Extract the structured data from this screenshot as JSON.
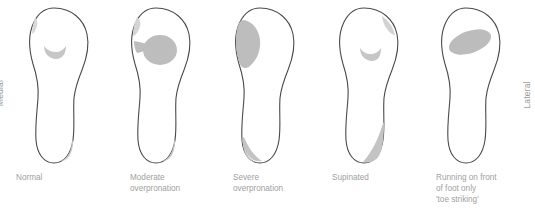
{
  "figure": {
    "background_color": "#ffffff",
    "outline_color": "#4a4a4a",
    "wear_color": "#b9b9b9",
    "wear_color_light": "#d6d6d6",
    "text_color": "#a0a0a0"
  },
  "orientation": {
    "left_label": "Medial",
    "right_label": "Lateral"
  },
  "soles": [
    {
      "id": "normal",
      "caption_lines": [
        "Normal"
      ],
      "wear_regions": [
        "small-forefoot-crescent-center",
        "faint-medial-toe-edge",
        "small-lateral-heel-wedge"
      ]
    },
    {
      "id": "moderate-overpronation",
      "caption_lines": [
        "Moderate",
        "overpronation"
      ],
      "wear_regions": [
        "large-forefoot-blob-with-medial-tail",
        "faint-medial-toe-edge",
        "small-lateral-heel-wedge"
      ]
    },
    {
      "id": "severe-overpronation",
      "caption_lines": [
        "Severe",
        "overpronation"
      ],
      "wear_regions": [
        "large-medial-forefoot-teardrop",
        "medial-heel-wedge"
      ]
    },
    {
      "id": "supinated",
      "caption_lines": [
        "Supinated"
      ],
      "wear_regions": [
        "small-forefoot-crescent-center",
        "faint-lateral-toe-patch",
        "large-lateral-heel-triangle"
      ]
    },
    {
      "id": "toe-striking",
      "caption_lines": [
        "Running on front",
        "of foot only",
        "'toe striking'"
      ],
      "wear_regions": [
        "large-diagonal-forefoot-ellipse"
      ]
    }
  ]
}
